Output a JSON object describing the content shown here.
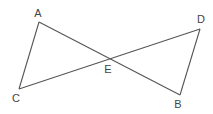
{
  "diagram": {
    "points": {
      "A": {
        "label": "A",
        "x": 39,
        "y": 22,
        "lx": 38,
        "ly": 17
      },
      "B": {
        "label": "B",
        "x": 180,
        "y": 95,
        "lx": 178,
        "ly": 108
      },
      "C": {
        "label": "C",
        "x": 19,
        "y": 89,
        "lx": 16,
        "ly": 102
      },
      "D": {
        "label": "D",
        "x": 200,
        "y": 29,
        "lx": 201,
        "ly": 23
      },
      "E": {
        "label": "E",
        "x": 109,
        "y": 60,
        "lx": 108,
        "ly": 73
      }
    },
    "segments": [
      [
        "A",
        "B"
      ],
      [
        "C",
        "D"
      ],
      [
        "A",
        "C"
      ],
      [
        "D",
        "B"
      ]
    ]
  }
}
